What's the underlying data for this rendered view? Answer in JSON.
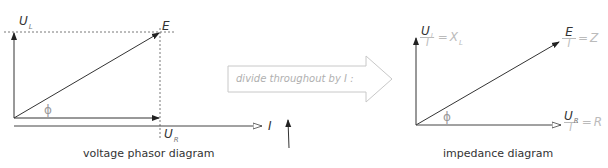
{
  "voltage_diagram": {
    "caption": "voltage phasor diagram",
    "labels": {
      "U_L_main": "U",
      "U_L_sub": "L",
      "E": "E",
      "U_R_main": "U",
      "U_R_sub": "R",
      "phi": "ϕ",
      "I": "I"
    }
  },
  "transition": {
    "label": "divide throughout by I :"
  },
  "impedance_diagram": {
    "caption": "impedance diagram",
    "labels": {
      "XL_num_main": "U",
      "XL_num_sub": "L",
      "XL_den": "I",
      "XL_result_main": "X",
      "XL_result_sub": "L",
      "Z_num": "E",
      "Z_den": "I",
      "Z_result": "Z",
      "R_num_main": "U",
      "R_num_sub": "R",
      "R_den": "I",
      "R_result": "R",
      "phi": "ϕ",
      "equals": "="
    }
  },
  "colors": {
    "line": "#333333",
    "dashed": "#555555",
    "faint": "#bbbbbb",
    "arrow_outline": "#c8c8c8"
  }
}
